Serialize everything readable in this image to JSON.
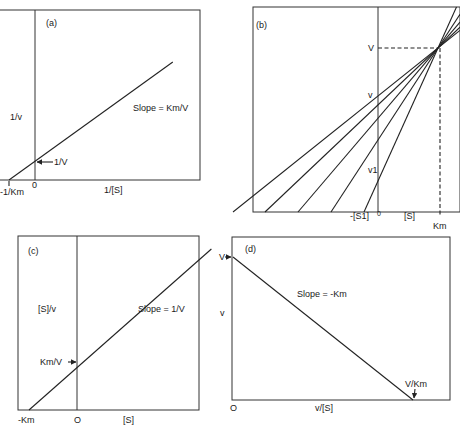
{
  "figure": {
    "panels": [
      {
        "id": "a",
        "tag": "(a)",
        "title": "Lineweaver-Burk plot",
        "ylabel": "1/v",
        "xlabel": "1/[S]",
        "origin_label": "0",
        "x_intercept_label": "-1/Km",
        "y_intercept_label": "1/V",
        "slope_label": "Slope = Km/V"
      },
      {
        "id": "b",
        "tag": "(b)",
        "title": "Direct linear plot",
        "y_mark_V": "V",
        "y_mark_v": "v",
        "y_mark_v1": "v1",
        "origin_label": "0",
        "x_neg_label": "-[S1]",
        "xlabel": "[S]",
        "x_mark_Km": "Km"
      },
      {
        "id": "c",
        "tag": "(c)",
        "title": "Hanes-Woolf plot",
        "ylabel": "[S]/v",
        "xlabel": "[S]",
        "origin_label": "O",
        "x_intercept_label": "-Km",
        "y_intercept_label": "Km/V",
        "slope_label": "Slope = 1/V"
      },
      {
        "id": "d",
        "tag": "(d)",
        "title": "Eadie-Hofstee plot",
        "ylabel": "v",
        "xlabel": "v/[S]",
        "origin_label": "O",
        "y_intercept_label": "V",
        "x_intercept_label": "V/Km",
        "slope_label": "Slope = -Km"
      }
    ]
  },
  "chart_data": [
    {
      "type": "line",
      "panel": "a",
      "title": "",
      "xlabel": "1/[S]",
      "ylabel": "1/v",
      "grid": false,
      "series": [
        {
          "name": "1/v vs 1/[S]",
          "points": [
            [
              -1,
              0
            ],
            [
              0,
              0.16
            ],
            [
              5.3,
              1.0
            ]
          ]
        }
      ],
      "annotations": [
        "-1/Km",
        "0",
        "1/V",
        "Slope = Km/V"
      ],
      "note": "schematic; x in units of 1/Km, y normalized"
    },
    {
      "type": "line",
      "panel": "b",
      "title": "",
      "xlabel": "[S]",
      "ylabel": "v",
      "grid": false,
      "series": [
        {
          "name": "line 1",
          "x_intercept": -2.4
        },
        {
          "name": "line 2",
          "x_intercept": -1.9
        },
        {
          "name": "line 3",
          "x_intercept": -1.4
        },
        {
          "name": "line 4",
          "x_intercept": -0.9
        },
        {
          "name": "line 5 ([S1])",
          "x_intercept": -0.4
        }
      ],
      "convergence_point": {
        "x": "Km",
        "y": "V"
      },
      "annotations": [
        "V",
        "v",
        "v1",
        "-[S1]",
        "0",
        "[S]",
        "Km"
      ],
      "note": "schematic; lines converge at (Km, V)"
    },
    {
      "type": "line",
      "panel": "c",
      "title": "",
      "xlabel": "[S]",
      "ylabel": "[S]/v",
      "grid": false,
      "series": [
        {
          "name": "[S]/v vs [S]",
          "points": [
            [
              -1,
              0
            ],
            [
              0,
              0.29
            ],
            [
              2.8,
              1.0
            ]
          ]
        }
      ],
      "annotations": [
        "-Km",
        "O",
        "Km/V",
        "Slope = 1/V"
      ],
      "note": "schematic; x in units of Km"
    },
    {
      "type": "line",
      "panel": "d",
      "title": "",
      "xlabel": "v/[S]",
      "ylabel": "v",
      "grid": false,
      "series": [
        {
          "name": "v vs v/[S]",
          "points": [
            [
              0,
              1
            ],
            [
              1,
              0
            ]
          ]
        }
      ],
      "annotations": [
        "V",
        "V/Km",
        "O",
        "Slope = -Km"
      ],
      "note": "schematic; x in units of V/Km, y in units of V"
    }
  ]
}
